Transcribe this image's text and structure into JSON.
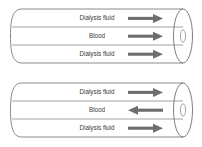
{
  "diagram": {
    "colors": {
      "outline": "#7d7d7d",
      "divider": "#8a8a8a",
      "arrow": "#6e6e6e",
      "label_text": "#3a3a3a",
      "background": "#ffffff"
    },
    "units": [
      {
        "name": "co-current-dialyser",
        "channels": [
          {
            "label": "Dialysis fluid",
            "arrow_direction": "right"
          },
          {
            "label": "Blood",
            "arrow_direction": "right"
          },
          {
            "label": "Dialysis fluid",
            "arrow_direction": "right"
          }
        ]
      },
      {
        "name": "counter-current-dialyser",
        "channels": [
          {
            "label": "Dialysis fluid",
            "arrow_direction": "right"
          },
          {
            "label": "Blood",
            "arrow_direction": "left"
          },
          {
            "label": "Dialysis fluid",
            "arrow_direction": "right"
          }
        ]
      }
    ]
  }
}
